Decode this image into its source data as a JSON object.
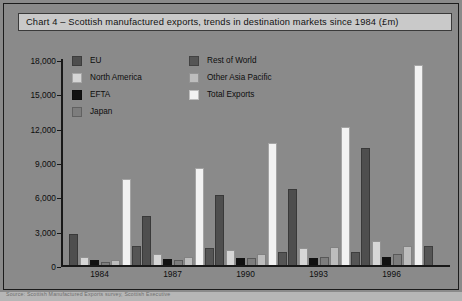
{
  "title": "Chart 4 – Scottish manufactured exports, trends in destination markets since 1984 (£m)",
  "source_note": "Source: Scottish Manufactured Exports survey, Scottish Executive",
  "colors": {
    "background": "#8a8a8a",
    "title_bar": "#c9c9c9",
    "axis": "#181818",
    "eu": "#4e4e4e",
    "north_america": "#d6d6d6",
    "efta": "#111111",
    "japan": "#7d7d7d",
    "rest_of_world": "#555555",
    "other_asia_pacific": "#bdbdbd",
    "total_exports": "#f2f2f2"
  },
  "legend": {
    "left_column": [
      {
        "label": "EU",
        "color": "#4e4e4e",
        "key": "eu"
      },
      {
        "label": "North America",
        "color": "#d6d6d6",
        "key": "north_america"
      },
      {
        "label": "EFTA",
        "color": "#111111",
        "key": "efta"
      },
      {
        "label": "Japan",
        "color": "#7d7d7d",
        "key": "japan"
      }
    ],
    "right_column": [
      {
        "label": "Rest of World",
        "color": "#555555",
        "key": "rest_of_world"
      },
      {
        "label": "Other Asia Pacific",
        "color": "#bdbdbd",
        "key": "other_asia_pacific"
      },
      {
        "label": "Total Exports",
        "color": "#f2f2f2",
        "key": "total_exports"
      }
    ]
  },
  "chart_data": {
    "type": "bar",
    "title": "Chart 4 – Scottish manufactured exports, trends in destination markets since 1984 (£m)",
    "xlabel": "",
    "ylabel": "",
    "ylim": [
      0,
      18000
    ],
    "yticks": [
      0,
      3000,
      6000,
      9000,
      12000,
      15000,
      18000
    ],
    "ytick_labels": [
      "0",
      "3,000",
      "6,000",
      "9,000",
      "12,000",
      "15,000",
      "18,000"
    ],
    "grid": false,
    "legend_position": "top-left",
    "categories": [
      "1984",
      "1987",
      "1990",
      "1993",
      "1996"
    ],
    "series": [
      {
        "name": "EU",
        "color": "#4e4e4e",
        "values": [
          2700,
          4300,
          6100,
          6600,
          10200
        ]
      },
      {
        "name": "North America",
        "color": "#d6d6d6",
        "values": [
          700,
          1000,
          1300,
          1500,
          2100
        ]
      },
      {
        "name": "EFTA",
        "color": "#111111",
        "values": [
          400,
          500,
          600,
          600,
          700
        ]
      },
      {
        "name": "Japan",
        "color": "#7d7d7d",
        "values": [
          300,
          400,
          600,
          700,
          1000
        ]
      },
      {
        "name": "Other Asia Pacific",
        "color": "#bdbdbd",
        "values": [
          400,
          700,
          1000,
          1600,
          1700
        ]
      },
      {
        "name": "Total Exports",
        "color": "#f2f2f2",
        "values": [
          7500,
          8500,
          10700,
          12100,
          17500
        ]
      },
      {
        "name": "Rest of World",
        "color": "#555555",
        "values": [
          1700,
          1500,
          1100,
          1100,
          1700
        ]
      }
    ]
  }
}
